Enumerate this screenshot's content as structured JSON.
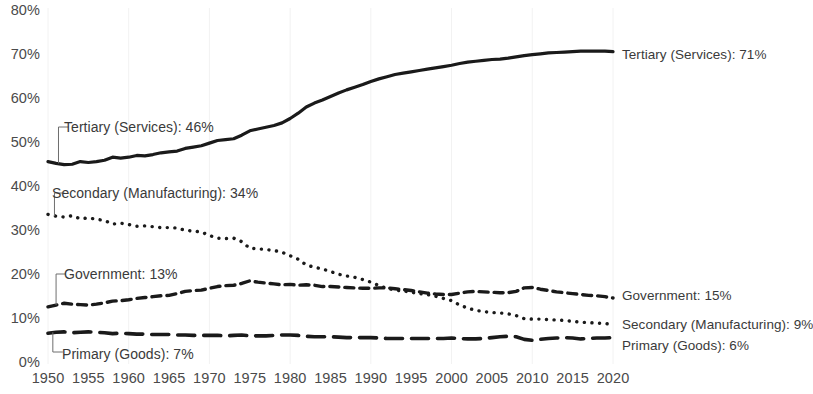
{
  "chart_data": {
    "type": "line",
    "title": "",
    "subtitle": "",
    "xlabel": "",
    "ylabel": "",
    "xlim": [
      1950,
      2020
    ],
    "ylim": [
      0,
      80
    ],
    "grid": "faint vertical gridlines at decades",
    "legend_position": "inline end-of-line labels",
    "y_ticks": [
      "0%",
      "10%",
      "20%",
      "30%",
      "40%",
      "50%",
      "60%",
      "70%",
      "80%"
    ],
    "y_tick_values": [
      0,
      10,
      20,
      30,
      40,
      50,
      60,
      70,
      80
    ],
    "x_ticks": [
      "1950",
      "1955",
      "1960",
      "1965",
      "1970",
      "1975",
      "1980",
      "1985",
      "1990",
      "1995",
      "2000",
      "2005",
      "2010",
      "2015",
      "2020"
    ],
    "x_tick_values": [
      1950,
      1955,
      1960,
      1965,
      1970,
      1975,
      1980,
      1985,
      1990,
      1995,
      2000,
      2005,
      2010,
      2015,
      2020
    ],
    "x": [
      1950,
      1951,
      1952,
      1953,
      1954,
      1955,
      1956,
      1957,
      1958,
      1959,
      1960,
      1961,
      1962,
      1963,
      1964,
      1965,
      1966,
      1967,
      1968,
      1969,
      1970,
      1971,
      1972,
      1973,
      1974,
      1975,
      1976,
      1977,
      1978,
      1979,
      1980,
      1981,
      1982,
      1983,
      1984,
      1985,
      1986,
      1987,
      1988,
      1989,
      1990,
      1991,
      1992,
      1993,
      1994,
      1995,
      1996,
      1997,
      1998,
      1999,
      2000,
      2001,
      2002,
      2003,
      2004,
      2005,
      2006,
      2007,
      2008,
      2009,
      2010,
      2011,
      2012,
      2013,
      2014,
      2015,
      2016,
      2017,
      2018,
      2019,
      2020
    ],
    "series": [
      {
        "name": "Tertiary (Services)",
        "style": "solid",
        "start_label": "Tertiary (Services): 46%",
        "end_label": "Tertiary (Services): 71%",
        "start_value": 46,
        "end_value": 71,
        "values": [
          46,
          45.6,
          45.3,
          45.4,
          46.0,
          45.8,
          46.0,
          46.3,
          47.0,
          46.8,
          47.0,
          47.4,
          47.3,
          47.6,
          48.0,
          48.2,
          48.4,
          49.0,
          49.3,
          49.6,
          50.2,
          50.8,
          51.0,
          51.2,
          52.0,
          53.0,
          53.4,
          53.8,
          54.2,
          54.8,
          55.8,
          57.0,
          58.4,
          59.3,
          60.0,
          60.8,
          61.6,
          62.3,
          62.9,
          63.5,
          64.2,
          64.8,
          65.3,
          65.8,
          66.1,
          66.4,
          66.7,
          67.0,
          67.3,
          67.6,
          67.9,
          68.3,
          68.6,
          68.8,
          69.0,
          69.2,
          69.3,
          69.5,
          69.8,
          70.1,
          70.3,
          70.5,
          70.7,
          70.8,
          70.9,
          71.0,
          71.1,
          71.1,
          71.1,
          71.1,
          71.0
        ]
      },
      {
        "name": "Secondary (Manufacturing)",
        "style": "dotted",
        "start_label": "Secondary (Manufacturing): 34%",
        "end_label": "Secondary (Manufacturing): 9%",
        "start_value": 34,
        "end_value": 9,
        "values": [
          34,
          33.6,
          33.4,
          33.7,
          33.0,
          33.2,
          32.9,
          32.6,
          31.8,
          32.0,
          31.7,
          31.3,
          31.4,
          31.2,
          31.0,
          31.0,
          30.9,
          30.4,
          30.2,
          30.0,
          29.2,
          28.6,
          28.5,
          28.6,
          27.8,
          26.3,
          26.2,
          26.0,
          25.8,
          25.4,
          24.6,
          23.8,
          22.5,
          22.0,
          21.6,
          21.0,
          20.4,
          20.0,
          19.7,
          19.2,
          18.6,
          17.8,
          17.2,
          16.8,
          16.6,
          16.3,
          16.0,
          15.8,
          15.4,
          14.9,
          14.4,
          13.4,
          12.7,
          12.2,
          11.9,
          11.7,
          11.6,
          11.4,
          11.0,
          10.3,
          10.2,
          10.2,
          10.1,
          10.0,
          9.9,
          9.7,
          9.5,
          9.4,
          9.3,
          9.2,
          9.0
        ]
      },
      {
        "name": "Government",
        "style": "dashed",
        "start_label": "Government: 13%",
        "end_label": "Government: 15%",
        "start_value": 13,
        "end_value": 15,
        "values": [
          13,
          13.4,
          13.8,
          13.6,
          13.5,
          13.4,
          13.6,
          13.9,
          14.3,
          14.4,
          14.6,
          14.9,
          15.1,
          15.3,
          15.5,
          15.6,
          16.0,
          16.5,
          16.7,
          16.8,
          17.2,
          17.6,
          17.8,
          17.9,
          18.3,
          18.9,
          18.6,
          18.4,
          18.2,
          18.0,
          18.1,
          17.9,
          18.0,
          17.9,
          17.6,
          17.6,
          17.5,
          17.4,
          17.3,
          17.2,
          17.2,
          17.3,
          17.3,
          17.1,
          16.9,
          16.7,
          16.4,
          16.1,
          15.9,
          15.8,
          15.8,
          16.1,
          16.4,
          16.5,
          16.4,
          16.3,
          16.2,
          16.2,
          16.5,
          17.3,
          17.4,
          17.0,
          16.7,
          16.4,
          16.2,
          16.0,
          15.8,
          15.6,
          15.5,
          15.3,
          15.0
        ]
      },
      {
        "name": "Primary (Goods)",
        "style": "long-dashed",
        "start_label": "Primary (Goods): 7%",
        "end_label": "Primary (Goods): 6%",
        "start_value": 7,
        "end_value": 6,
        "values": [
          7,
          7.2,
          7.3,
          7.1,
          7.2,
          7.3,
          7.2,
          7.1,
          6.9,
          7.0,
          6.9,
          6.8,
          6.8,
          6.7,
          6.7,
          6.7,
          6.6,
          6.6,
          6.5,
          6.5,
          6.5,
          6.5,
          6.4,
          6.5,
          6.6,
          6.4,
          6.4,
          6.4,
          6.5,
          6.6,
          6.6,
          6.5,
          6.3,
          6.2,
          6.2,
          6.2,
          6.1,
          6.0,
          6.0,
          6.0,
          6.0,
          5.9,
          5.8,
          5.8,
          5.8,
          5.8,
          5.8,
          5.8,
          5.8,
          5.8,
          5.9,
          5.8,
          5.7,
          5.7,
          5.8,
          6.0,
          6.2,
          6.3,
          6.2,
          5.6,
          5.4,
          5.6,
          5.8,
          5.9,
          6.0,
          5.9,
          5.7,
          5.8,
          5.9,
          5.9,
          6.0
        ]
      }
    ],
    "annotations": [
      "Tertiary (Services): 46%",
      "Secondary (Manufacturing): 34%",
      "Government: 13%",
      "Primary (Goods): 7%",
      "Tertiary (Services): 71%",
      "Government: 15%",
      "Secondary (Manufacturing): 9%",
      "Primary (Goods): 6%"
    ],
    "colors": {
      "line": "#1a1a1a",
      "text": "#3a3a3a",
      "tick": "#4a4a4a",
      "grid": "#f2f2f2",
      "background": "#ffffff"
    }
  }
}
